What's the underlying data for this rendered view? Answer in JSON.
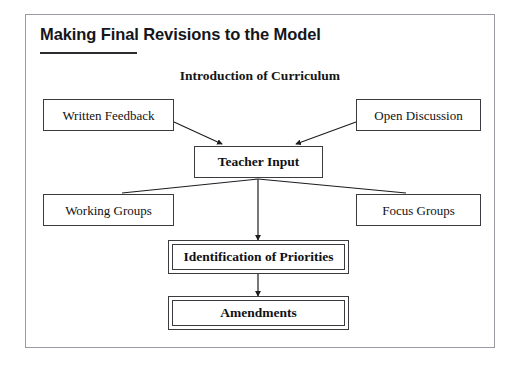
{
  "page": {
    "title": "Making Final Revisions to the Model",
    "subtitle": "Introduction of Curriculum"
  },
  "colors": {
    "frame_border": "#9a9aa2",
    "box_border": "#3a3a3f",
    "text": "#111114",
    "title_text": "#16161a",
    "rule": "#2b2b30",
    "background": "#ffffff"
  },
  "diagram": {
    "type": "flowchart",
    "nodes": [
      {
        "id": "written_feedback",
        "label": "Written Feedback",
        "style": "single",
        "weight": "regular",
        "row": 1,
        "column": "left"
      },
      {
        "id": "open_discussion",
        "label": "Open Discussion",
        "style": "single",
        "weight": "regular",
        "row": 1,
        "column": "right"
      },
      {
        "id": "teacher_input",
        "label": "Teacher Input",
        "style": "single",
        "weight": "bold",
        "row": 2,
        "column": "center"
      },
      {
        "id": "working_groups",
        "label": "Working Groups",
        "style": "single",
        "weight": "regular",
        "row": 3,
        "column": "left"
      },
      {
        "id": "focus_groups",
        "label": "Focus Groups",
        "style": "single",
        "weight": "regular",
        "row": 3,
        "column": "right"
      },
      {
        "id": "identification",
        "label": "Identification of Priorities",
        "style": "double",
        "weight": "bold",
        "row": 4,
        "column": "center"
      },
      {
        "id": "amendments",
        "label": "Amendments",
        "style": "double",
        "weight": "bold",
        "row": 5,
        "column": "center"
      }
    ],
    "edges": [
      {
        "from": "written_feedback",
        "to": "teacher_input",
        "arrow": true,
        "kind": "diagonal"
      },
      {
        "from": "open_discussion",
        "to": "teacher_input",
        "arrow": true,
        "kind": "diagonal"
      },
      {
        "from": "teacher_input",
        "to": "working_groups",
        "arrow": false,
        "kind": "diagonal"
      },
      {
        "from": "teacher_input",
        "to": "focus_groups",
        "arrow": false,
        "kind": "diagonal"
      },
      {
        "from": "teacher_input",
        "to": "identification",
        "arrow": true,
        "kind": "vertical"
      },
      {
        "from": "identification",
        "to": "amendments",
        "arrow": true,
        "kind": "vertical"
      }
    ]
  }
}
